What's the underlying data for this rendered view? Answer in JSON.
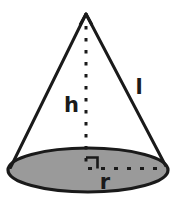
{
  "figure": {
    "kind": "geometry-diagram",
    "shape_name": "cone",
    "canvas": {
      "width": 178,
      "height": 208
    },
    "colors": {
      "background": "#ffffff",
      "base_fill": "#9a9a9a",
      "stroke": "#1a1a1a",
      "label": "#1a1a1a"
    },
    "labels": {
      "height": "h",
      "slant": "l",
      "radius": "r"
    },
    "geometry": {
      "apex": {
        "x": 86,
        "y": 14
      },
      "base_center": {
        "x": 88,
        "y": 170
      },
      "base_rx": 80,
      "base_ry": 22,
      "left_base_point": {
        "x": 10,
        "y": 168
      },
      "right_base_point": {
        "x": 166,
        "y": 166
      },
      "height_line": {
        "x": 86,
        "y1": 25,
        "y2": 168
      },
      "radius_line": {
        "y": 168,
        "x1": 88,
        "x2": 162
      },
      "right_angle_marker": {
        "x": 86,
        "y": 168,
        "size": 11
      }
    },
    "label_positions": {
      "height": {
        "x": 64,
        "y": 112
      },
      "slant": {
        "x": 137,
        "y": 94
      },
      "radius": {
        "x": 101,
        "y": 189
      }
    }
  }
}
